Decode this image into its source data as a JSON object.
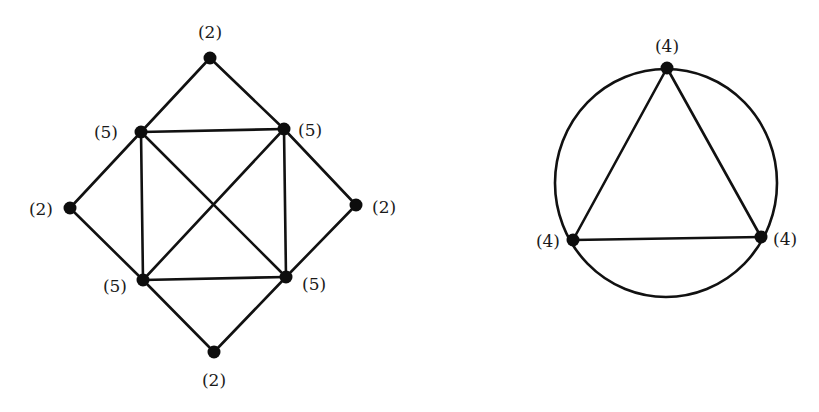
{
  "diagram": {
    "colors": {
      "ink": "#111111",
      "background": "#ffffff"
    },
    "graphs": [
      {
        "name": "octahedron-like-graph",
        "nodes": [
          {
            "id": "top",
            "x": 210,
            "y": 58,
            "label": "(2)",
            "lx": 210,
            "ly": 38,
            "anchor": "middle"
          },
          {
            "id": "upper_left",
            "x": 141,
            "y": 132,
            "label": "(5)",
            "lx": 118,
            "ly": 138,
            "anchor": "end"
          },
          {
            "id": "upper_right",
            "x": 284,
            "y": 129,
            "label": "(5)",
            "lx": 298,
            "ly": 136,
            "anchor": "start"
          },
          {
            "id": "left",
            "x": 70,
            "y": 208,
            "label": "(2)",
            "lx": 53,
            "ly": 215,
            "anchor": "end"
          },
          {
            "id": "right",
            "x": 356,
            "y": 205,
            "label": "(2)",
            "lx": 372,
            "ly": 213,
            "anchor": "start"
          },
          {
            "id": "lower_left",
            "x": 143,
            "y": 280,
            "label": "(5)",
            "lx": 127,
            "ly": 292,
            "anchor": "end"
          },
          {
            "id": "lower_right",
            "x": 286,
            "y": 277,
            "label": "(5)",
            "lx": 302,
            "ly": 290,
            "anchor": "start"
          },
          {
            "id": "bottom",
            "x": 214,
            "y": 352,
            "label": "(2)",
            "lx": 214,
            "ly": 386,
            "anchor": "middle"
          }
        ],
        "edges": [
          [
            "top",
            "upper_left"
          ],
          [
            "top",
            "upper_right"
          ],
          [
            "upper_left",
            "upper_right"
          ],
          [
            "upper_left",
            "left"
          ],
          [
            "upper_right",
            "right"
          ],
          [
            "upper_left",
            "lower_left"
          ],
          [
            "upper_right",
            "lower_right"
          ],
          [
            "upper_left",
            "lower_right"
          ],
          [
            "upper_right",
            "lower_left"
          ],
          [
            "left",
            "lower_left"
          ],
          [
            "right",
            "lower_right"
          ],
          [
            "lower_left",
            "lower_right"
          ],
          [
            "lower_left",
            "bottom"
          ],
          [
            "lower_right",
            "bottom"
          ]
        ]
      },
      {
        "name": "triangle-in-circle-graph",
        "circle": {
          "cx": 666,
          "cy": 183,
          "rx": 111,
          "ry": 114
        },
        "nodes": [
          {
            "id": "top",
            "x": 667,
            "y": 68,
            "label": "(4)",
            "lx": 667,
            "ly": 52,
            "anchor": "middle"
          },
          {
            "id": "left",
            "x": 573,
            "y": 240,
            "label": "(4)",
            "lx": 560,
            "ly": 247,
            "anchor": "end"
          },
          {
            "id": "right",
            "x": 761,
            "y": 237,
            "label": "(4)",
            "lx": 773,
            "ly": 245,
            "anchor": "start"
          }
        ],
        "edges": [
          [
            "top",
            "left"
          ],
          [
            "top",
            "right"
          ],
          [
            "left",
            "right"
          ]
        ]
      }
    ]
  }
}
